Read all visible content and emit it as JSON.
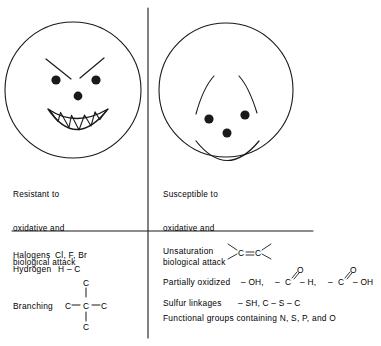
{
  "figure": {
    "panels": {
      "left": {
        "face": "angry-face",
        "caption_lines": [
          "Resistant to",
          "oxidative and",
          "biological attack"
        ]
      },
      "right": {
        "face": "happy-face",
        "caption_lines": [
          "Susceptible to",
          "oxidative and",
          "biological attack"
        ]
      }
    },
    "lower_left": {
      "rows": [
        {
          "label": "Halogens",
          "formula": "Cl, F, Br"
        },
        {
          "label": "Hydrogen",
          "formula": "H – C"
        },
        {
          "label": "Branching",
          "formula": "C – C – C"
        }
      ],
      "branching_structure": {
        "top_atom": "C",
        "left_atom": "C",
        "center_atom": "C",
        "right_atom": "C",
        "bottom_atom": "C"
      }
    },
    "lower_right": {
      "rows": [
        {
          "label": "Unsaturation",
          "formula": "C = C"
        },
        {
          "label": "Partially oxidized",
          "formula": "– OH, – C – H, – C – OH"
        },
        {
          "label": "Sulfur linkages",
          "formula": "– SH, C – S – C"
        },
        {
          "label": "Functional groups containing N, S, P, and O",
          "formula": ""
        }
      ],
      "unsaturation_atoms": {
        "left": "C",
        "bond": "=",
        "right": "C"
      },
      "oxidized_atoms": {
        "hydroxyl": "– OH,",
        "carbonyl_c1": "C",
        "carbonyl_o1": "O",
        "aldehyde_h": "– H,",
        "dash_before_c2": "–",
        "carbonyl_c2": "C",
        "carbonyl_o2": "O",
        "carboxyl_oh": "– OH"
      },
      "sulfur_atoms": "– SH, C – S – C"
    },
    "colors": {
      "ink": "#1a1a1a",
      "background": "#ffffff"
    }
  }
}
